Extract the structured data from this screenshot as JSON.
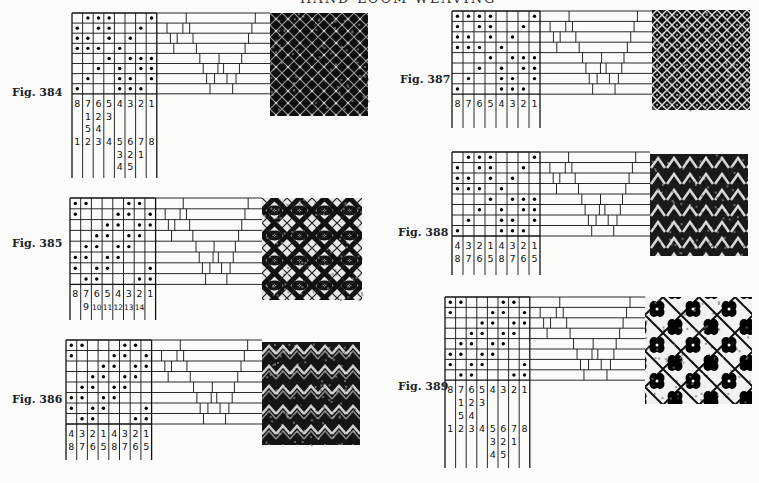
{
  "page": {
    "running_header": "HAND-LOOM WEAVING"
  },
  "figures": [
    {
      "id": "384",
      "label": "Fig. 384",
      "grid": [
        [
          0,
          1,
          1,
          1,
          0,
          0,
          0,
          1
        ],
        [
          1,
          0,
          1,
          1,
          0,
          0,
          1,
          0
        ],
        [
          1,
          1,
          0,
          1,
          0,
          1,
          0,
          0
        ],
        [
          1,
          1,
          1,
          0,
          1,
          0,
          0,
          0
        ],
        [
          0,
          0,
          0,
          1,
          0,
          1,
          1,
          1
        ],
        [
          0,
          0,
          1,
          0,
          1,
          0,
          1,
          1
        ],
        [
          0,
          1,
          0,
          0,
          1,
          1,
          0,
          1
        ],
        [
          1,
          0,
          0,
          0,
          1,
          1,
          1,
          0
        ]
      ],
      "number_rows": [
        [
          "8",
          "7",
          "6",
          "5",
          "4",
          "3",
          "2",
          "1"
        ],
        [
          "",
          "1",
          "2",
          "3",
          "",
          "",
          "",
          ""
        ],
        [
          "",
          "5",
          "4",
          "",
          "",
          "",
          "",
          ""
        ],
        [
          "1",
          "2",
          "3",
          "4",
          "5",
          "6",
          "7",
          "8"
        ],
        [
          "",
          "",
          "",
          "",
          "3",
          "2",
          "1",
          ""
        ],
        [
          "",
          "",
          "",
          "",
          "4",
          "5",
          "",
          ""
        ]
      ],
      "fabric_pattern": "dark-crossed-lattice"
    },
    {
      "id": "385",
      "label": "Fig. 385",
      "grid": [
        [
          1,
          1,
          0,
          0,
          0,
          1,
          1,
          0
        ],
        [
          1,
          0,
          0,
          0,
          1,
          1,
          0,
          1
        ],
        [
          0,
          0,
          0,
          1,
          1,
          0,
          1,
          1
        ],
        [
          0,
          0,
          1,
          1,
          0,
          1,
          1,
          0
        ],
        [
          0,
          1,
          1,
          0,
          1,
          1,
          0,
          0
        ],
        [
          1,
          1,
          0,
          1,
          1,
          0,
          0,
          0
        ],
        [
          1,
          0,
          1,
          1,
          0,
          0,
          0,
          1
        ],
        [
          0,
          1,
          1,
          0,
          0,
          0,
          1,
          1
        ]
      ],
      "number_rows": [
        [
          "8",
          "7",
          "6",
          "5",
          "4",
          "3",
          "2",
          "1"
        ],
        [
          "",
          "9",
          "10",
          "11",
          "12",
          "13",
          "14",
          ""
        ]
      ],
      "fabric_pattern": "diamond-eyes"
    },
    {
      "id": "386",
      "label": "Fig. 386",
      "grid": [
        [
          1,
          1,
          0,
          0,
          0,
          1,
          1,
          0
        ],
        [
          1,
          0,
          0,
          0,
          1,
          1,
          0,
          1
        ],
        [
          0,
          0,
          0,
          1,
          1,
          0,
          1,
          1
        ],
        [
          0,
          0,
          1,
          1,
          0,
          1,
          1,
          0
        ],
        [
          0,
          1,
          1,
          0,
          1,
          1,
          0,
          0
        ],
        [
          1,
          1,
          0,
          1,
          1,
          0,
          0,
          0
        ],
        [
          1,
          0,
          1,
          1,
          0,
          0,
          0,
          1
        ],
        [
          0,
          1,
          1,
          0,
          0,
          0,
          1,
          1
        ]
      ],
      "number_rows": [
        [
          "4",
          "3",
          "2",
          "1",
          "4",
          "3",
          "2",
          "1"
        ],
        [
          "8",
          "7",
          "6",
          "5",
          "8",
          "7",
          "6",
          "5"
        ]
      ],
      "fabric_pattern": "zigzag-waves"
    },
    {
      "id": "387",
      "label": "Fig. 387",
      "grid": [
        [
          1,
          1,
          1,
          1,
          0,
          0,
          0,
          1
        ],
        [
          1,
          0,
          1,
          1,
          0,
          0,
          1,
          0
        ],
        [
          1,
          1,
          0,
          1,
          0,
          1,
          0,
          0
        ],
        [
          1,
          1,
          1,
          0,
          1,
          0,
          0,
          0
        ],
        [
          0,
          0,
          0,
          1,
          0,
          1,
          1,
          1
        ],
        [
          0,
          0,
          1,
          0,
          1,
          0,
          1,
          1
        ],
        [
          0,
          1,
          0,
          0,
          1,
          1,
          0,
          1
        ],
        [
          1,
          0,
          0,
          0,
          1,
          1,
          1,
          0
        ]
      ],
      "number_rows": [
        [
          "8",
          "7",
          "6",
          "5",
          "4",
          "3",
          "2",
          "1"
        ]
      ],
      "fabric_pattern": "fine-lattice"
    },
    {
      "id": "388",
      "label": "Fig. 388",
      "grid": [
        [
          0,
          1,
          1,
          1,
          0,
          0,
          0,
          1
        ],
        [
          1,
          0,
          1,
          1,
          0,
          0,
          1,
          0
        ],
        [
          1,
          1,
          0,
          1,
          0,
          1,
          0,
          0
        ],
        [
          1,
          1,
          1,
          0,
          1,
          0,
          0,
          0
        ],
        [
          0,
          0,
          0,
          1,
          0,
          1,
          1,
          1
        ],
        [
          0,
          0,
          1,
          0,
          1,
          0,
          1,
          1
        ],
        [
          0,
          1,
          0,
          0,
          1,
          1,
          0,
          1
        ],
        [
          1,
          0,
          0,
          0,
          1,
          1,
          1,
          0
        ]
      ],
      "number_rows": [
        [
          "4",
          "3",
          "2",
          "1",
          "4",
          "3",
          "2",
          "1"
        ],
        [
          "8",
          "7",
          "6",
          "5",
          "8",
          "7",
          "6",
          "5"
        ]
      ],
      "fabric_pattern": "chevron-scales"
    },
    {
      "id": "389",
      "label": "Fig. 389",
      "grid": [
        [
          1,
          1,
          0,
          0,
          0,
          1,
          1,
          0
        ],
        [
          1,
          0,
          0,
          0,
          1,
          1,
          0,
          1
        ],
        [
          0,
          0,
          0,
          1,
          1,
          0,
          1,
          1
        ],
        [
          0,
          0,
          1,
          1,
          0,
          1,
          1,
          0
        ],
        [
          0,
          1,
          1,
          0,
          1,
          1,
          0,
          0
        ],
        [
          1,
          1,
          0,
          1,
          1,
          0,
          0,
          0
        ],
        [
          1,
          0,
          1,
          1,
          0,
          0,
          0,
          1
        ],
        [
          0,
          1,
          1,
          0,
          0,
          0,
          1,
          1
        ]
      ],
      "number_rows": [
        [
          "8",
          "7",
          "6",
          "5",
          "4",
          "3",
          "2",
          "1"
        ],
        [
          "",
          "1",
          "2",
          "3",
          "",
          "",
          "",
          ""
        ],
        [
          "",
          "5",
          "4",
          "",
          "",
          "",
          "",
          ""
        ],
        [
          "1",
          "2",
          "3",
          "4",
          "5",
          "6",
          "7",
          "8"
        ],
        [
          "",
          "",
          "",
          "",
          "3",
          "2",
          "1",
          ""
        ],
        [
          "",
          "",
          "",
          "",
          "4",
          "5",
          "",
          ""
        ]
      ],
      "fabric_pattern": "bold-blossoms"
    }
  ],
  "threading_dividers": [
    [
      0.26,
      0.87
    ],
    [
      0.09,
      0.23,
      0.29,
      0.84
    ],
    [
      0.12,
      0.18,
      0.32,
      0.81
    ],
    [
      0.15,
      0.35,
      0.78
    ],
    [
      0.38,
      0.55,
      0.75
    ],
    [
      0.41,
      0.54,
      0.59,
      0.73
    ],
    [
      0.44,
      0.51,
      0.62,
      0.7
    ],
    [
      0.47,
      0.67
    ]
  ]
}
